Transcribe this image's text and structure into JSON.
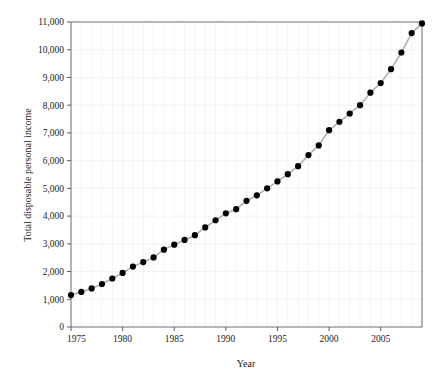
{
  "chart_data": {
    "type": "line",
    "title": "",
    "xlabel": "Year",
    "ylabel": "Total disposable personal income",
    "xlim": [
      1975,
      2009
    ],
    "ylim": [
      0,
      11000
    ],
    "grid": true,
    "legend": false,
    "legend_position": "none",
    "marker": "filled-circle",
    "line_color": "#b0b0b0",
    "marker_color": "#000000",
    "xticks": [
      1975,
      1980,
      1985,
      1990,
      1995,
      2000,
      2005
    ],
    "xtick_labels": [
      "1975",
      "1980",
      "1985",
      "1990",
      "1995",
      "2000",
      "2005"
    ],
    "yticks": [
      0,
      1000,
      2000,
      3000,
      4000,
      5000,
      6000,
      7000,
      8000,
      9000,
      10000,
      11000
    ],
    "ytick_labels": [
      "0",
      "1,000",
      "2,000",
      "3,000",
      "4,000",
      "5,000",
      "6,000",
      "7,000",
      "8,000",
      "9,000",
      "10,000",
      "11,000"
    ],
    "x": [
      1975,
      1976,
      1977,
      1978,
      1979,
      1980,
      1981,
      1982,
      1983,
      1984,
      1985,
      1986,
      1987,
      1988,
      1989,
      1990,
      1991,
      1992,
      1993,
      1994,
      1995,
      1996,
      1997,
      1998,
      1999,
      2000,
      2001,
      2002,
      2003,
      2004,
      2005,
      2006,
      2007,
      2008,
      2009
    ],
    "values": [
      1150,
      1265,
      1390,
      1550,
      1750,
      1950,
      2180,
      2340,
      2510,
      2790,
      2970,
      3140,
      3310,
      3590,
      3850,
      4100,
      4250,
      4550,
      4750,
      5000,
      5250,
      5510,
      5800,
      6200,
      6550,
      7100,
      7400,
      7700,
      8000,
      8450,
      8800,
      9300,
      9900,
      10600,
      10950
    ]
  }
}
